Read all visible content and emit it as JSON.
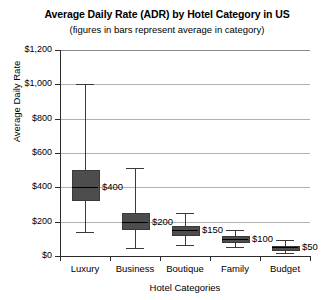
{
  "chart_data": {
    "type": "bar",
    "title": "Average Daily Rate (ADR) by Hotel Category in US",
    "subtitle": "(figures in bars represent average in category)",
    "xlabel": "Hotel Categories",
    "ylabel": "Average Daily Rate",
    "ylim": [
      0,
      1200
    ],
    "ytick_labels": [
      "$1,200",
      "$1,000",
      "$800",
      "$600",
      "$400",
      "$200",
      "$0"
    ],
    "ytick_values": [
      1200,
      1000,
      800,
      600,
      400,
      200,
      0
    ],
    "grid": true,
    "legend": "none",
    "categories": [
      "Luxury",
      "Business",
      "Boutique",
      "Family",
      "Budget"
    ],
    "values": [
      400,
      200,
      150,
      100,
      50
    ],
    "value_labels": [
      "$400",
      "$200",
      "$150",
      "$100",
      "$50"
    ],
    "series": [
      {
        "name": "ADR distribution",
        "boxes": [
          {
            "category": "Luxury",
            "whisker_high": 1000,
            "box_high": 500,
            "median": 400,
            "box_low": 330,
            "whisker_low": 140,
            "label": "$400"
          },
          {
            "category": "Business",
            "whisker_high": 510,
            "box_high": 250,
            "median": 200,
            "box_low": 165,
            "whisker_low": 45,
            "label": "$200"
          },
          {
            "category": "Boutique",
            "whisker_high": 250,
            "box_high": 175,
            "median": 150,
            "box_low": 130,
            "whisker_low": 65,
            "label": "$150"
          },
          {
            "category": "Family",
            "whisker_high": 150,
            "box_high": 115,
            "median": 100,
            "box_low": 88,
            "whisker_low": 55,
            "label": "$100"
          },
          {
            "category": "Budget",
            "whisker_high": 95,
            "box_high": 60,
            "median": 50,
            "box_low": 42,
            "whisker_low": 15,
            "label": "$50"
          }
        ]
      }
    ]
  }
}
